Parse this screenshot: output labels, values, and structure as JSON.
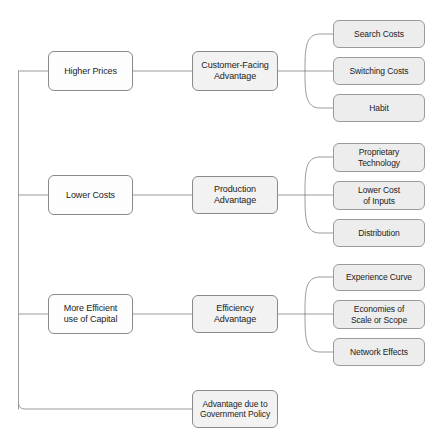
{
  "diagram": {
    "type": "hierarchy-tree",
    "orientation": "left-to-right",
    "colors": {
      "line": "#9b9b9b",
      "box_border": "#8a8a8a",
      "level1_fill": "#fdfdfd",
      "level2_fill": "#f2f2f2",
      "level3_fill": "#ededed",
      "text": "#1c1c1c",
      "background": "#ffffff"
    },
    "branches": [
      {
        "id": "higher-prices",
        "level1": "Higher Prices",
        "level2": "Customer-Facing Advantage",
        "level2_lines": [
          "Customer-Facing",
          "Advantage"
        ],
        "level3": [
          {
            "id": "search-costs",
            "label": "Search Costs",
            "lines": [
              "Search Costs"
            ]
          },
          {
            "id": "switching-costs",
            "label": "Switching Costs",
            "lines": [
              "Switching Costs"
            ]
          },
          {
            "id": "habit",
            "label": "Habit",
            "lines": [
              "Habit"
            ]
          }
        ]
      },
      {
        "id": "lower-costs",
        "level1": "Lower Costs",
        "level2": "Production Advantage",
        "level2_lines": [
          "Production",
          "Advantage"
        ],
        "level3": [
          {
            "id": "proprietary-technology",
            "label": "Proprietary Technology",
            "lines": [
              "Proprietary",
              "Technology"
            ]
          },
          {
            "id": "lower-cost-of-inputs",
            "label": "Lower Cost of Inputs",
            "lines": [
              "Lower Cost",
              "of Inputs"
            ]
          },
          {
            "id": "distribution",
            "label": "Distribution",
            "lines": [
              "Distribution"
            ]
          }
        ]
      },
      {
        "id": "more-efficient-capital",
        "level1": "More Efficient use of Capital",
        "level1_lines": [
          "More Efficient",
          "use of Capital"
        ],
        "level2": "Efficiency Advantage",
        "level2_lines": [
          "Efficiency",
          "Advantage"
        ],
        "level3": [
          {
            "id": "experience-curve",
            "label": "Experience Curve",
            "lines": [
              "Experience Curve"
            ]
          },
          {
            "id": "economies-of-scale-or-scope",
            "label": "Economies of Scale or Scope",
            "lines": [
              "Economies of",
              "Scale or Scope"
            ]
          },
          {
            "id": "network-effects",
            "label": "Network Effects",
            "lines": [
              "Network Effects"
            ]
          }
        ]
      }
    ],
    "standalone": {
      "id": "advantage-government-policy",
      "label": "Advantage due to Government Policy",
      "lines": [
        "Advantage due to",
        "Government Policy"
      ]
    }
  }
}
